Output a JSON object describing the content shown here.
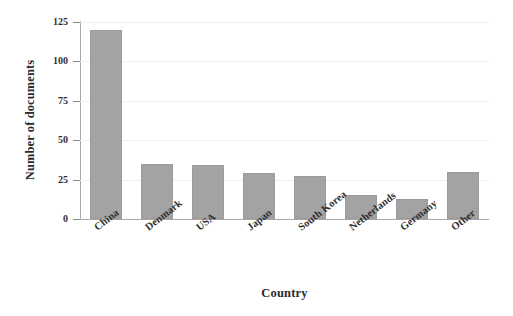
{
  "chart_data": {
    "type": "bar",
    "title": "",
    "xlabel": "Country",
    "ylabel": "Number of documents",
    "categories": [
      "China",
      "Denmark",
      "USA",
      "Japan",
      "South Korea",
      "Netherlands",
      "Germany",
      "Other"
    ],
    "values": [
      120,
      35,
      34,
      29,
      27,
      15,
      13,
      30
    ],
    "ylim": [
      0,
      125
    ],
    "yticks": [
      0,
      25,
      50,
      75,
      100,
      125
    ],
    "ytick_labels": [
      "0",
      "25",
      "50",
      "75",
      "100",
      "125"
    ],
    "grid": true,
    "grid_axis": "y",
    "legend": false,
    "legend_position": "none",
    "bar_color": "#a3a3a3",
    "bar_edge_color": "#9b9b9b",
    "axis_color": "#a8a8a8",
    "grid_color": "#efefef",
    "text_color": "#2f2f2f",
    "background": "#ffffff",
    "xtick_rotation": -38
  }
}
